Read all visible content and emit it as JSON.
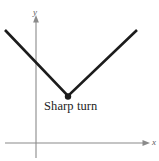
{
  "figure": {
    "background_color": "#ffffff",
    "width": 159,
    "height": 161
  },
  "axes": {
    "x_label": "x",
    "y_label": "y",
    "axis_color": "#8a8a8a",
    "origin": {
      "x": 36,
      "y": 143
    },
    "x_axis": {
      "start_x": 5,
      "end_x": 149,
      "y": 143,
      "arrow": "right"
    },
    "y_axis": {
      "x": 36,
      "start_y": 158,
      "end_y": 17,
      "arrow": "up"
    }
  },
  "annotations": [
    {
      "name": "sharp-turn-label",
      "text": "Sharp turn",
      "color": "#232323",
      "x": 44,
      "y": 100
    }
  ],
  "chart_data": {
    "type": "line",
    "title": "Sharp turn",
    "xlabel": "x",
    "ylabel": "y",
    "grid": false,
    "legend": null,
    "curve_color": "#1c1c1c",
    "curve_width": 2.6,
    "vertex_marker": {
      "name": "sharp-turn-point",
      "shape": "dot",
      "radius": 3.2,
      "color": "#1c1c1c",
      "x": 68,
      "y": 96
    },
    "series": [
      {
        "name": "v-shaped-curve",
        "points_px": [
          {
            "x": 5,
            "y": 30
          },
          {
            "x": 68,
            "y": 96
          },
          {
            "x": 137,
            "y": 30
          }
        ]
      }
    ]
  }
}
